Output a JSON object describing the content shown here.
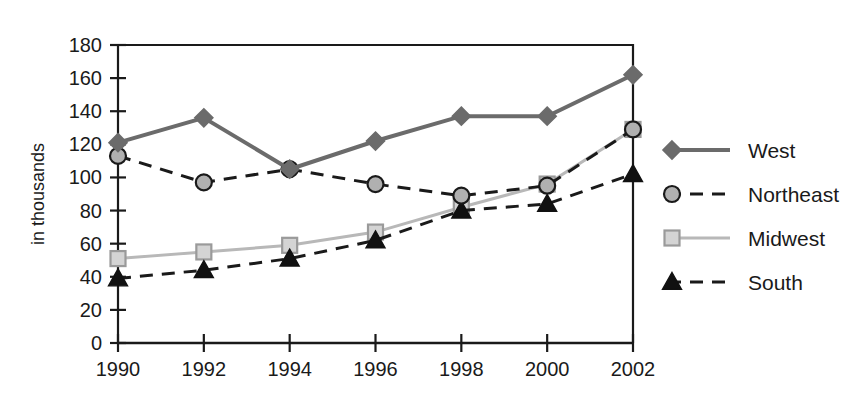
{
  "chart_data": {
    "type": "line",
    "title": "",
    "xlabel": "",
    "ylabel": "in thousands",
    "categories": [
      "1990",
      "1992",
      "1994",
      "1996",
      "1998",
      "2000",
      "2002"
    ],
    "x": [
      1990,
      1992,
      1994,
      1996,
      1998,
      2000,
      2002
    ],
    "ylim": [
      0,
      180
    ],
    "xlim": [
      1990,
      2002
    ],
    "ytick_labels": [
      "0",
      "20",
      "40",
      "60",
      "80",
      "100",
      "120",
      "140",
      "160",
      "180"
    ],
    "ytick_values": [
      0,
      20,
      40,
      60,
      80,
      100,
      120,
      140,
      160,
      180
    ],
    "xtick_labels": [
      "1990",
      "1992",
      "1994",
      "1996",
      "1998",
      "2000",
      "2002"
    ],
    "grid": false,
    "legend_position": "right",
    "series": [
      {
        "name": "West",
        "values": [
          121,
          136,
          105,
          122,
          137,
          137,
          162
        ],
        "color": "#6b6b6b",
        "marker": "diamond",
        "marker_fill": "#6b6b6b",
        "line_style": "solid",
        "line_width": 4
      },
      {
        "name": "Northeast",
        "values": [
          113,
          97,
          105,
          96,
          89,
          95,
          129
        ],
        "color": "#1a1a1a",
        "marker": "circle",
        "marker_fill": "#b0b0b0",
        "line_style": "dashed",
        "line_width": 3
      },
      {
        "name": "Midwest",
        "values": [
          51,
          55,
          59,
          67,
          82,
          96,
          129
        ],
        "color": "#b8b8b8",
        "marker": "square",
        "marker_fill": "#d4d4d4",
        "line_style": "solid",
        "line_width": 3
      },
      {
        "name": "South",
        "values": [
          39,
          44,
          51,
          62,
          80,
          84,
          102
        ],
        "color": "#1a1a1a",
        "marker": "triangle",
        "marker_fill": "#111111",
        "line_style": "dashed",
        "line_width": 3
      }
    ]
  },
  "legend": {
    "items": [
      {
        "label": "West"
      },
      {
        "label": "Northeast"
      },
      {
        "label": "Midwest"
      },
      {
        "label": "South"
      }
    ]
  },
  "axes": {
    "y_axis_title": "in thousands"
  }
}
